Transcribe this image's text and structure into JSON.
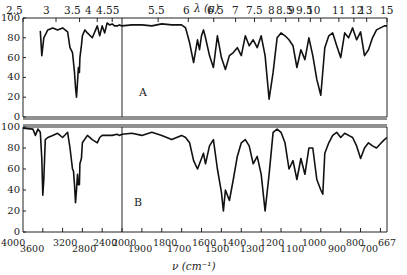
{
  "chart_data": {
    "type": "line",
    "title": "",
    "top_axis": {
      "label": "λ (μ)",
      "ticks": [
        "2.5",
        "3",
        "3.5",
        "4",
        "4.55",
        "5.5",
        "6",
        "6.5",
        "7",
        "7.5",
        "8",
        "8.5",
        "9",
        "9.5",
        "10",
        "11",
        "12",
        "13",
        "15"
      ]
    },
    "bottom_axis": {
      "label": "ν (cm⁻¹)",
      "ticks": [
        "4000",
        "3600",
        "3200",
        "2800",
        "2400",
        "2000",
        "1900",
        "1800",
        "1700",
        "1600",
        "1500",
        "1400",
        "1300",
        "1200",
        "1100",
        "1000",
        "900",
        "800",
        "700",
        "667"
      ]
    },
    "ylabel": "",
    "ylim": [
      0,
      100
    ],
    "y_ticks": [
      "0",
      "20",
      "40",
      "60",
      "80",
      "100"
    ],
    "grid": false,
    "scale_break_at_cm1": 2000,
    "panels": [
      {
        "name": "A",
        "series": [
          {
            "name": "Spectrum A",
            "x_cm1": [
              3650,
              3620,
              3580,
              3500,
              3400,
              3300,
              3200,
              3100,
              3050,
              3000,
              2980,
              2960,
              2940,
              2930,
              2920,
              2900,
              2880,
              2860,
              2850,
              2820,
              2800,
              2750,
              2700,
              2600,
              2500,
              2450,
              2400,
              2350,
              2300,
              2250,
              2200,
              2150,
              2100,
              2050,
              2000,
              1950,
              1900,
              1850,
              1800,
              1750,
              1700,
              1680,
              1660,
              1640,
              1620,
              1610,
              1600,
              1590,
              1580,
              1560,
              1540,
              1520,
              1500,
              1480,
              1460,
              1440,
              1420,
              1400,
              1380,
              1360,
              1340,
              1320,
              1300,
              1280,
              1260,
              1240,
              1220,
              1200,
              1180,
              1160,
              1140,
              1120,
              1100,
              1080,
              1060,
              1040,
              1020,
              1000,
              980,
              960,
              940,
              920,
              900,
              880,
              860,
              840,
              820,
              800,
              780,
              760,
              740,
              720,
              700,
              680,
              667
            ],
            "y": [
              87,
              62,
              80,
              88,
              90,
              88,
              90,
              86,
              70,
              65,
              55,
              45,
              30,
              25,
              20,
              35,
              50,
              45,
              60,
              72,
              82,
              88,
              85,
              80,
              92,
              82,
              92,
              85,
              95,
              93,
              94,
              92,
              92,
              93,
              92,
              93,
              93,
              92,
              94,
              93,
              93,
              90,
              75,
              55,
              78,
              68,
              82,
              88,
              80,
              62,
              50,
              82,
              60,
              48,
              62,
              65,
              70,
              62,
              82,
              72,
              78,
              70,
              82,
              62,
              18,
              45,
              80,
              85,
              82,
              78,
              72,
              50,
              68,
              58,
              80,
              62,
              38,
              22,
              70,
              82,
              85,
              72,
              60,
              85,
              80,
              90,
              78,
              86,
              62,
              68,
              80,
              88,
              90,
              92,
              92
            ]
          }
        ]
      },
      {
        "name": "B",
        "series": [
          {
            "name": "Spectrum B",
            "x_cm1": [
              4000,
              3800,
              3750,
              3700,
              3650,
              3620,
              3600,
              3580,
              3550,
              3500,
              3400,
              3300,
              3200,
              3100,
              3050,
              3000,
              2980,
              2960,
              2940,
              2920,
              2900,
              2880,
              2860,
              2850,
              2820,
              2800,
              2700,
              2600,
              2500,
              2450,
              2400,
              2300,
              2200,
              2100,
              2050,
              2000,
              1950,
              1900,
              1850,
              1800,
              1750,
              1700,
              1680,
              1660,
              1640,
              1620,
              1600,
              1590,
              1580,
              1560,
              1540,
              1520,
              1500,
              1490,
              1480,
              1460,
              1440,
              1420,
              1400,
              1380,
              1360,
              1340,
              1320,
              1300,
              1280,
              1260,
              1240,
              1220,
              1200,
              1180,
              1160,
              1140,
              1120,
              1100,
              1080,
              1060,
              1040,
              1020,
              1000,
              990,
              980,
              960,
              940,
              920,
              900,
              880,
              860,
              840,
              820,
              800,
              780,
              760,
              740,
              720,
              700,
              680,
              667
            ],
            "y": [
              99,
              98,
              92,
              98,
              95,
              70,
              35,
              50,
              88,
              90,
              92,
              94,
              90,
              95,
              80,
              60,
              58,
              45,
              28,
              40,
              55,
              45,
              45,
              65,
              70,
              85,
              92,
              88,
              85,
              90,
              92,
              92,
              92,
              93,
              92,
              93,
              94,
              92,
              95,
              92,
              88,
              92,
              90,
              85,
              68,
              60,
              70,
              75,
              65,
              82,
              88,
              60,
              38,
              20,
              40,
              30,
              50,
              72,
              85,
              88,
              82,
              65,
              72,
              55,
              20,
              55,
              95,
              98,
              95,
              85,
              60,
              68,
              50,
              70,
              55,
              80,
              80,
              50,
              40,
              36,
              75,
              85,
              92,
              95,
              90,
              94,
              92,
              90,
              82,
              70,
              80,
              85,
              82,
              80,
              84,
              88,
              90
            ]
          }
        ]
      }
    ],
    "annotations": [
      "A",
      "B"
    ]
  }
}
